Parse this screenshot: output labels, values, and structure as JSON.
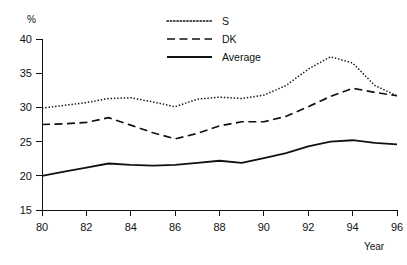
{
  "chart_data": {
    "type": "line",
    "title": "",
    "subtitle": "",
    "xlabel": "Year",
    "ylabel": "%",
    "xlim": [
      80,
      96
    ],
    "ylim": [
      15,
      40
    ],
    "grid": false,
    "legend_position": "top-center",
    "x": [
      80,
      81,
      82,
      83,
      84,
      85,
      86,
      87,
      88,
      89,
      90,
      91,
      92,
      93,
      94,
      95,
      96
    ],
    "xticks": [
      "80",
      "82",
      "84",
      "86",
      "88",
      "90",
      "92",
      "94",
      "96"
    ],
    "xtick_values": [
      80,
      82,
      84,
      86,
      88,
      90,
      92,
      94,
      96
    ],
    "yticks": [
      "15",
      "20",
      "25",
      "30",
      "35",
      "40"
    ],
    "ytick_values": [
      15,
      20,
      25,
      30,
      35,
      40
    ],
    "series": [
      {
        "name": "S",
        "style": "dotted",
        "color": "#111111",
        "values": [
          29.9,
          30.3,
          30.7,
          31.3,
          31.4,
          30.8,
          30.1,
          31.2,
          31.5,
          31.3,
          31.8,
          33.2,
          35.6,
          37.4,
          36.5,
          33.2,
          31.7
        ]
      },
      {
        "name": "DK",
        "style": "dashed",
        "color": "#111111",
        "values": [
          27.5,
          27.6,
          27.8,
          28.5,
          27.4,
          26.3,
          25.4,
          26.2,
          27.3,
          27.9,
          27.9,
          28.7,
          30.1,
          31.6,
          32.8,
          32.2,
          31.7
        ]
      },
      {
        "name": "Average",
        "style": "solid",
        "color": "#111111",
        "values": [
          20.0,
          20.6,
          21.2,
          21.8,
          21.6,
          21.5,
          21.6,
          21.9,
          22.2,
          21.9,
          22.6,
          23.3,
          24.3,
          25.0,
          25.2,
          24.8,
          24.6
        ]
      }
    ]
  },
  "legend": {
    "items": [
      {
        "label": "S",
        "style": "dotted"
      },
      {
        "label": "DK",
        "style": "dashed"
      },
      {
        "label": "Average",
        "style": "solid"
      }
    ]
  },
  "axes": {
    "y_unit_label": "%",
    "x_title_label": "Year"
  }
}
